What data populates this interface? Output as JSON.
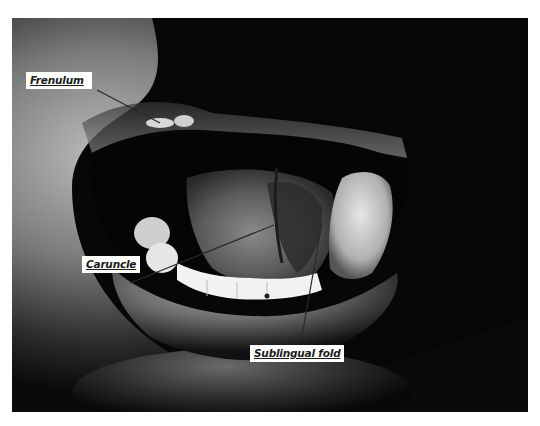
{
  "figure": {
    "palette": {
      "background": "#ffffff",
      "photo_dark": "#070707",
      "skin_light": "#b8b8b8",
      "teeth": "#f2f2f2",
      "label_bg": "#ffffff",
      "label_text": "#1a1a1a",
      "leader_line": "#2a2a2a"
    },
    "labels": [
      {
        "id": "frenulum",
        "text": "Frenulum"
      },
      {
        "id": "caruncle",
        "text": "Caruncle"
      },
      {
        "id": "sublingual_fold",
        "text": "Sublingual fold"
      }
    ]
  }
}
